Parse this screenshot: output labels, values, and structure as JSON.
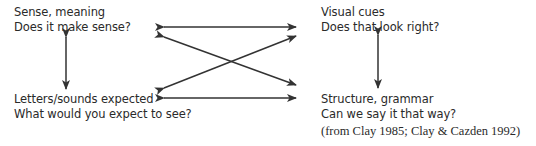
{
  "diagram": {
    "nodes": {
      "top_left": {
        "title": "Sense, meaning",
        "question": "Does it make sense?"
      },
      "top_right": {
        "title": "Visual cues",
        "question": "Does that look right?"
      },
      "bottom_left": {
        "title": "Letters/sounds expected",
        "question": "What would you expect to see?"
      },
      "bottom_right": {
        "title": "Structure, grammar",
        "question": "Can we say it that way?"
      }
    },
    "citation": "(from Clay 1985; Clay & Cazden 1992)",
    "edges": [
      {
        "from": "top_left",
        "to": "top_right",
        "type": "bidirectional"
      },
      {
        "from": "top_left",
        "to": "bottom_right",
        "type": "bidirectional"
      },
      {
        "from": "bottom_left",
        "to": "top_right",
        "type": "bidirectional"
      },
      {
        "from": "bottom_left",
        "to": "bottom_right",
        "type": "bidirectional"
      },
      {
        "from": "top_left",
        "to": "bottom_left",
        "type": "bidirectional"
      },
      {
        "from": "top_right",
        "to": "bottom_right",
        "type": "bidirectional"
      }
    ],
    "colors": {
      "text": "#2a2a2a",
      "arrow": "#333333"
    }
  }
}
